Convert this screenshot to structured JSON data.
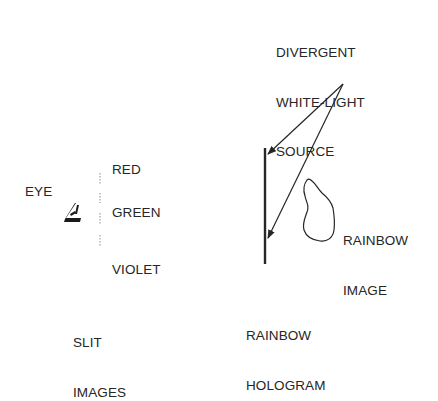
{
  "diagram": {
    "type": "rainbow-hologram-viewing",
    "colors": {
      "ink": "#262626",
      "slit": "#8a8a8a",
      "background": "#ffffff"
    },
    "source": {
      "label_lines": [
        "DIVERGENT",
        "WHITE-LIGHT",
        "SOURCE"
      ]
    },
    "hologram": {
      "label_lines": [
        "RAINBOW",
        "HOLOGRAM"
      ]
    },
    "image": {
      "label_lines": [
        "RAINBOW",
        "IMAGE"
      ]
    },
    "eye": {
      "label": "EYE"
    },
    "slits": {
      "colors": [
        "RED",
        "GREEN",
        "VIOLET"
      ],
      "label_lines": [
        "SLIT",
        "IMAGES"
      ]
    }
  }
}
